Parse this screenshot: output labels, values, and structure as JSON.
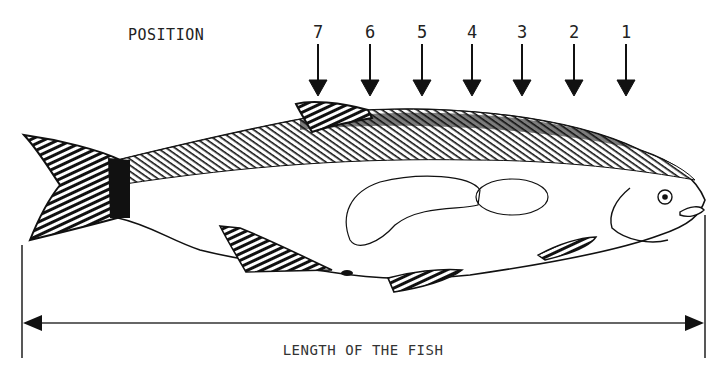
{
  "diagram": {
    "position_title": "POSITION",
    "positions": [
      {
        "label": "7",
        "x": 318
      },
      {
        "label": "6",
        "x": 370
      },
      {
        "label": "5",
        "x": 422
      },
      {
        "label": "4",
        "x": 472
      },
      {
        "label": "3",
        "x": 522
      },
      {
        "label": "2",
        "x": 574
      },
      {
        "label": "1",
        "x": 626
      }
    ],
    "length_label": "LENGTH OF THE FISH",
    "subject": "fish",
    "colors": {
      "ink": "#111111",
      "background": "#ffffff"
    }
  }
}
